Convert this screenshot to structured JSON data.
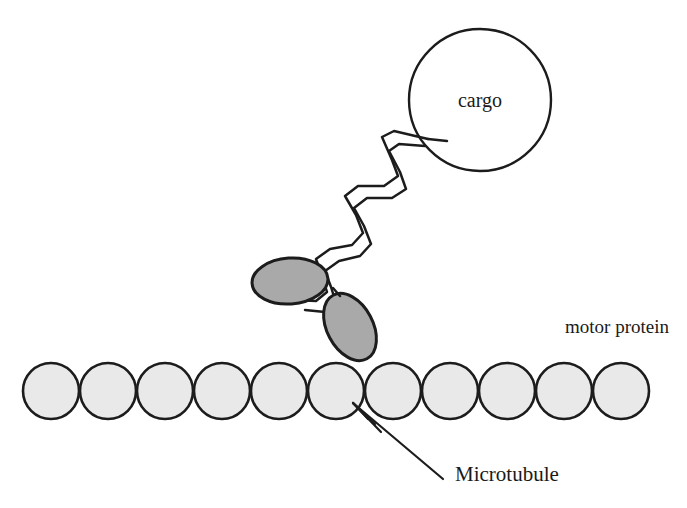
{
  "figure": {
    "background_color": "#ffffff",
    "line_color": "#1c1c1c",
    "width": 687,
    "height": 508
  },
  "cargo": {
    "label": "cargo",
    "shape": "circle",
    "center_x": 480,
    "center_y": 100,
    "radius": 71,
    "fill_color": "#ffffff",
    "stroke_color": "#1c1c1c"
  },
  "tail": {
    "name": "coiled-coil-tail",
    "description": "double-stranded zigzag coiled coil connecting cargo to motor heads",
    "strand_count": 2,
    "stroke_color": "#1c1c1c"
  },
  "motor_protein": {
    "label": "motor protein",
    "label_x": 565,
    "label_y": 333,
    "heads": [
      {
        "name": "motor-head-upper",
        "center_x": 290,
        "center_y": 281,
        "rx": 38,
        "ry": 23,
        "rotation_deg": -4,
        "fill_color": "#a9a9a9",
        "stroke_color": "#1c1c1c"
      },
      {
        "name": "motor-head-lower",
        "center_x": 350,
        "center_y": 327,
        "rx": 36,
        "ry": 23,
        "rotation_deg": 62,
        "fill_color": "#a9a9a9",
        "stroke_color": "#1c1c1c"
      }
    ]
  },
  "microtubule": {
    "label": "Microtubule",
    "label_x": 455,
    "label_y": 481,
    "subunit_count": 11,
    "subunit_radius": 28,
    "subunit_pitch": 57,
    "first_center_x": 51,
    "center_y": 391,
    "fill_color": "#e9e9e9",
    "stroke_color": "#1c1c1c",
    "subunit_centers_x": [
      51,
      108,
      165,
      222,
      279,
      336,
      393,
      450,
      507,
      564,
      621
    ]
  },
  "pointer": {
    "name": "microtubule-pointer-arrow",
    "tip_x": 352,
    "tip_y": 402,
    "tail_x": 443,
    "tail_y": 479,
    "stroke_color": "#1c1c1c"
  }
}
